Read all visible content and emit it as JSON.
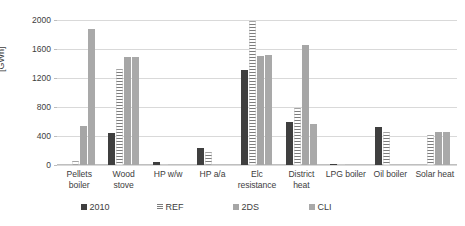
{
  "chart_data": {
    "type": "bar",
    "title": "",
    "xlabel": "",
    "ylabel": "[GWh]",
    "ylim": [
      0,
      2000
    ],
    "yticks": [
      0,
      400,
      800,
      1200,
      1600,
      2000
    ],
    "grid": true,
    "legend_position": "bottom",
    "categories": [
      "Pellets\nboiler",
      "Wood\nstove",
      "HP w/w",
      "HP a/a",
      "Elc\nresistance",
      "District\nheat",
      "LPG boiler",
      "Oil boiler",
      "Solar heat"
    ],
    "series": [
      {
        "name": "2010",
        "color": "#3f3f3f",
        "values": [
          0,
          440,
          35,
          240,
          1310,
          590,
          10,
          525,
          0
        ]
      },
      {
        "name": "REF",
        "color": "#7d7d7d",
        "values": [
          50,
          1320,
          15,
          180,
          1990,
          790,
          8,
          450,
          415
        ]
      },
      {
        "name": "2DS",
        "color": "#a6a6a6",
        "values": [
          540,
          1490,
          0,
          0,
          1510,
          1650,
          0,
          0,
          450
        ]
      },
      {
        "name": "CLI",
        "color": "#a9a9a9",
        "values": [
          1880,
          1490,
          0,
          0,
          1515,
          565,
          0,
          0,
          450
        ]
      }
    ]
  },
  "legend": {
    "items": [
      {
        "label": "2010"
      },
      {
        "label": "REF"
      },
      {
        "label": "2DS"
      },
      {
        "label": "CLI"
      }
    ]
  }
}
